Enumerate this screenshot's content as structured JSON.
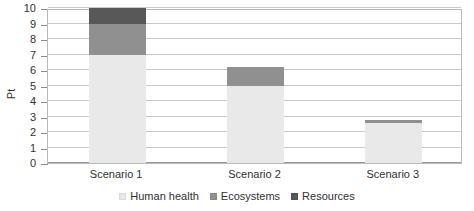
{
  "chart_data": {
    "type": "bar",
    "subtype": "stacked-bar",
    "title": "",
    "xlabel": "",
    "ylabel": "Pt",
    "categories": [
      "Scenario 1",
      "Scenario 2",
      "Scenario 3"
    ],
    "series": [
      {
        "name": "Human health",
        "color": "#e9e9e9",
        "values": [
          7.0,
          5.0,
          2.55
        ]
      },
      {
        "name": "Ecosystems",
        "color": "#909090",
        "values": [
          2.0,
          1.2,
          0.25
        ]
      },
      {
        "name": "Resources",
        "color": "#585858",
        "values": [
          1.0,
          0.0,
          0.0
        ]
      }
    ],
    "totals": [
      10.0,
      6.2,
      2.8
    ],
    "ylim": [
      0,
      10
    ],
    "yticks": [
      0,
      1,
      2,
      3,
      4,
      5,
      6,
      7,
      8,
      9,
      10
    ],
    "ytick_labels": [
      "0",
      "1",
      "2",
      "3",
      "4",
      "5",
      "6",
      "7",
      "8",
      "9",
      "10"
    ],
    "grid": true,
    "grid_axis": "y",
    "legend_position": "bottom-center",
    "legend_entries": [
      "Human health",
      "Ecosystems",
      "Resources"
    ],
    "plot_border": true,
    "background": "#ffffff"
  }
}
